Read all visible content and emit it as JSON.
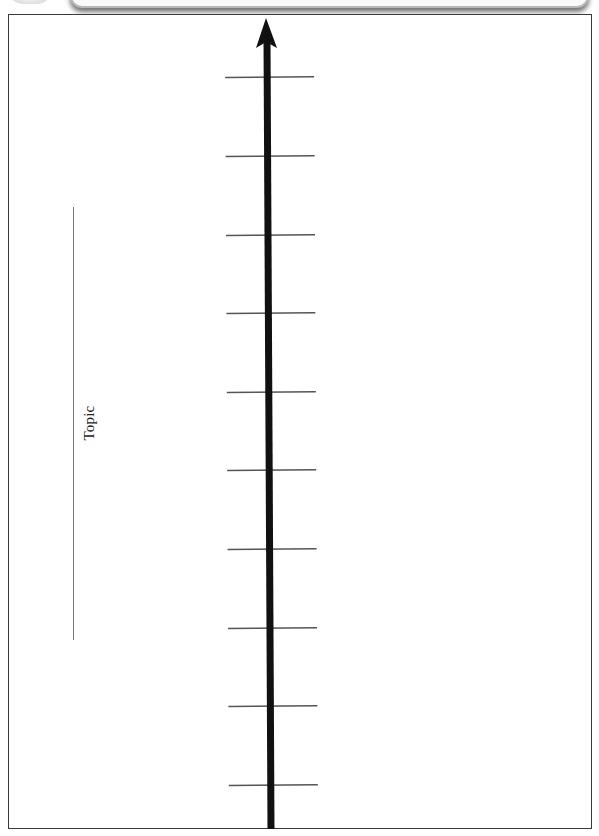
{
  "worksheet": {
    "type": "timeline-template",
    "topic_label": "Topic",
    "axis": {
      "direction": "up",
      "color": "#111111",
      "tick_count": 10,
      "ticks": [
        {
          "y": 77
        },
        {
          "y": 156
        },
        {
          "y": 235
        },
        {
          "y": 313
        },
        {
          "y": 392
        },
        {
          "y": 470
        },
        {
          "y": 549
        },
        {
          "y": 628
        },
        {
          "y": 706
        },
        {
          "y": 785
        }
      ]
    },
    "colors": {
      "frame": "#3a3a3a",
      "tick": "#555555",
      "topic_line": "#7a7a7a"
    }
  }
}
